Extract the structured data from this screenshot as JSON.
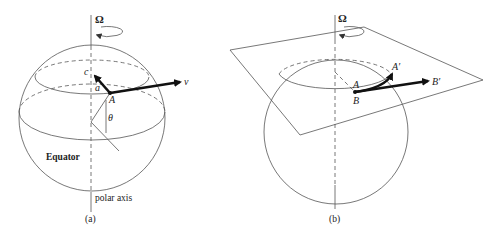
{
  "panel_a": {
    "omega_label": "Ω",
    "point_A": "A",
    "point_c": "c",
    "vector_v": "v",
    "angle_a": "a",
    "angle_theta": "θ",
    "equator_label": "Equator",
    "axis_label": "polar axis",
    "caption": "(a)"
  },
  "panel_b": {
    "omega_label": "Ω",
    "point_A": "A",
    "point_B": "B",
    "point_A_prime": "A′",
    "point_B_prime": "B′",
    "caption": "(b)"
  },
  "colors": {
    "line": "#555555",
    "bold_vector": "#111111",
    "background": "#ffffff"
  }
}
